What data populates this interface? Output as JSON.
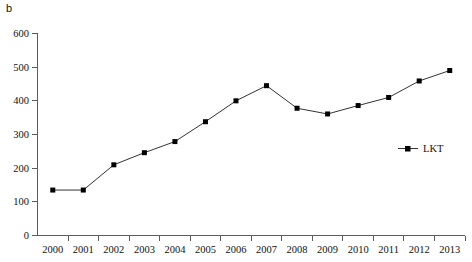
{
  "panel": {
    "label": "b"
  },
  "chart_data": {
    "type": "line",
    "title": "",
    "subtitle": "",
    "xlabel": "",
    "ylabel": "",
    "categories": [
      "2000",
      "2001",
      "2002",
      "2003",
      "2004",
      "2005",
      "2006",
      "2007",
      "2008",
      "2009",
      "2010",
      "2011",
      "2012",
      "2013"
    ],
    "series": [
      {
        "name": "LKT",
        "values": [
          135,
          135,
          210,
          246,
          279,
          338,
          400,
          445,
          378,
          361,
          386,
          410,
          459,
          490
        ],
        "color": "#000000",
        "marker": "square"
      }
    ],
    "ylim": [
      0,
      600
    ],
    "yticks": [
      0,
      100,
      200,
      300,
      400,
      500,
      600
    ],
    "ytick_labels": [
      "0",
      "100",
      "200",
      "300",
      "400",
      "500",
      "600"
    ],
    "xtick_labels": [
      "2000",
      "2001",
      "2002",
      "2003",
      "2004",
      "2005",
      "2006",
      "2007",
      "2008",
      "2009",
      "2010",
      "2011",
      "2012",
      "2013"
    ],
    "grid": false,
    "legend": {
      "position": "right-middle",
      "entries": [
        "LKT"
      ]
    }
  },
  "legend": {
    "lkt_label": "LKT"
  },
  "axis": {
    "y_labels": [
      "600",
      "500",
      "400",
      "300",
      "200",
      "100",
      "0"
    ],
    "x_labels": [
      "2000",
      "2001",
      "2002",
      "2003",
      "2004",
      "2005",
      "2006",
      "2007",
      "2008",
      "2009",
      "2010",
      "2011",
      "2012",
      "2013"
    ]
  }
}
